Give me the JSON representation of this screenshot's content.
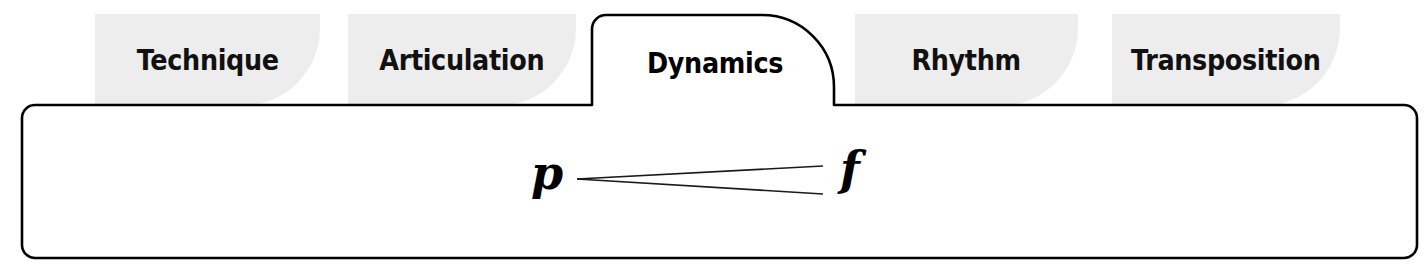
{
  "panel": {
    "name": "music-practice-category-tabs",
    "tabs": [
      {
        "id": "technique",
        "label": "Technique",
        "selected": false
      },
      {
        "id": "articulation",
        "label": "Articulation",
        "selected": false
      },
      {
        "id": "dynamics",
        "label": "Dynamics",
        "selected": true
      },
      {
        "id": "rhythm",
        "label": "Rhythm",
        "selected": false
      },
      {
        "id": "transposition",
        "label": "Transposition",
        "selected": false
      }
    ],
    "selected_tab": "Dynamics",
    "content": {
      "notation": {
        "start_dynamic": "p",
        "end_dynamic": "f",
        "marking": "crescendo-hairpin"
      }
    },
    "colors": {
      "inactive_tab_fill": "#ededed",
      "active_tab_fill": "#ffffff",
      "outline": "#000000",
      "text": "#111111",
      "page_background": "#ffffff"
    }
  }
}
